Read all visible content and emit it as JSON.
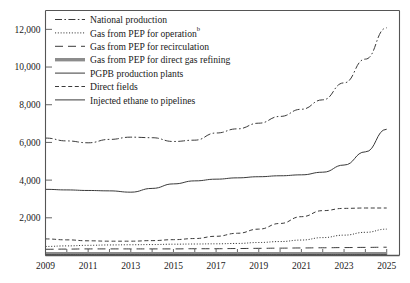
{
  "chart_data": {
    "type": "line",
    "title": "",
    "subtitle": "",
    "xlabel": "",
    "ylabel": "",
    "xlim": [
      2009,
      2025.6
    ],
    "ylim": [
      0,
      13000
    ],
    "grid": false,
    "legend_position": "top-left",
    "x": [
      2009,
      2010,
      2011,
      2012,
      2013,
      2014,
      2015,
      2016,
      2017,
      2018,
      2019,
      2020,
      2021,
      2022,
      2023,
      2024,
      2025
    ],
    "x_ticks": [
      2009,
      2010,
      2011,
      2012,
      2013,
      2014,
      2015,
      2016,
      2017,
      2018,
      2019,
      2020,
      2021,
      2022,
      2023,
      2024,
      2025
    ],
    "x_tick_labels": [
      "2009",
      "",
      "2011",
      "",
      "2013",
      "",
      "2015",
      "",
      "2017",
      "",
      "2019",
      "",
      "2021",
      "",
      "2023",
      "",
      "2025"
    ],
    "y_ticks": [
      2000,
      4000,
      6000,
      8000,
      10000,
      12000
    ],
    "y_tick_labels": [
      "2,000",
      "4,000",
      "6,000",
      "8,000",
      "10,000",
      "12,000"
    ],
    "series": [
      {
        "name": "National production",
        "style": "dashdot",
        "color": "#3a3a3a",
        "width": 1.0,
        "values": [
          6230,
          6080,
          5980,
          6160,
          6280,
          6250,
          6050,
          6120,
          6500,
          6720,
          7020,
          7380,
          7760,
          8260,
          9160,
          10420,
          12080
        ]
      },
      {
        "name": "Gas from PEP for operation",
        "superscript": "b",
        "style": "dotted",
        "color": "#3a3a3a",
        "width": 1.0,
        "values": [
          480,
          510,
          540,
          560,
          570,
          580,
          600,
          610,
          620,
          640,
          690,
          740,
          820,
          950,
          1080,
          1230,
          1400
        ]
      },
      {
        "name": "Gas from PEP for recirculation",
        "style": "longdash",
        "color": "#3a3a3a",
        "width": 1.0,
        "values": [
          330,
          340,
          350,
          350,
          350,
          350,
          350,
          360,
          360,
          370,
          380,
          390,
          400,
          410,
          420,
          430,
          440
        ]
      },
      {
        "name": "Gas from PEP for direct gas refining",
        "style": "thickband",
        "color": "#8c8c8c",
        "width": 3.4,
        "values": [
          95,
          95,
          95,
          95,
          95,
          95,
          95,
          95,
          95,
          95,
          95,
          95,
          95,
          95,
          95,
          95,
          95
        ]
      },
      {
        "name": "PGPB production plants",
        "style": "solid",
        "color": "#3a3a3a",
        "width": 1.0,
        "values": [
          3510,
          3480,
          3450,
          3430,
          3360,
          3560,
          3800,
          3960,
          4050,
          4120,
          4180,
          4230,
          4280,
          4420,
          4800,
          5500,
          6700
        ]
      },
      {
        "name": "Direct fields",
        "style": "shortdash",
        "color": "#3a3a3a",
        "width": 1.0,
        "values": [
          880,
          830,
          780,
          760,
          760,
          790,
          840,
          900,
          1020,
          1180,
          1400,
          1700,
          2060,
          2380,
          2500,
          2520,
          2520
        ]
      },
      {
        "name": "Injected ethane to pipelines",
        "style": "solid",
        "color": "#3a3a3a",
        "width": 1.0,
        "values": [
          40,
          40,
          40,
          40,
          40,
          40,
          40,
          40,
          40,
          40,
          40,
          40,
          40,
          40,
          40,
          40,
          40
        ]
      }
    ]
  },
  "legend": {
    "items": [
      {
        "label": "National production",
        "sup": ""
      },
      {
        "label": "Gas from PEP for operation",
        "sup": "b"
      },
      {
        "label": "Gas from PEP for recirculation",
        "sup": ""
      },
      {
        "label": "Gas from PEP for direct gas refining",
        "sup": ""
      },
      {
        "label": "PGPB production plants",
        "sup": ""
      },
      {
        "label": "Direct fields",
        "sup": ""
      },
      {
        "label": "Injected ethane to pipelines",
        "sup": ""
      }
    ]
  },
  "colors": {
    "ink": "#1a1a1a",
    "axis": "#555555",
    "series": "#3a3a3a",
    "band": "#8c8c8c",
    "background": "#ffffff"
  }
}
